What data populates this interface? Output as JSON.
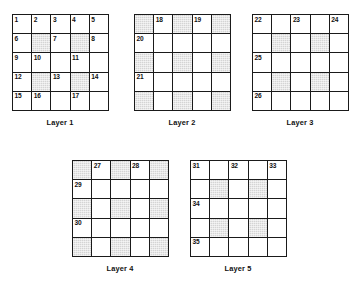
{
  "figure": {
    "title": "",
    "grid_size": 5,
    "shade_color": "#d4d4d4",
    "line_color": "#1a1a1a",
    "background": "#ffffff"
  },
  "layers": [
    {
      "caption": "Layer 1",
      "x": 12,
      "y": 14,
      "cells": [
        {
          "num": "1",
          "shaded": false
        },
        {
          "num": "2",
          "shaded": false
        },
        {
          "num": "3",
          "shaded": false
        },
        {
          "num": "4",
          "shaded": false
        },
        {
          "num": "5",
          "shaded": false
        },
        {
          "num": "6",
          "shaded": false
        },
        {
          "num": "",
          "shaded": true
        },
        {
          "num": "7",
          "shaded": false
        },
        {
          "num": "",
          "shaded": true
        },
        {
          "num": "8",
          "shaded": false
        },
        {
          "num": "9",
          "shaded": false
        },
        {
          "num": "10",
          "shaded": false
        },
        {
          "num": "",
          "shaded": false
        },
        {
          "num": "11",
          "shaded": false
        },
        {
          "num": "",
          "shaded": false
        },
        {
          "num": "12",
          "shaded": false
        },
        {
          "num": "",
          "shaded": true
        },
        {
          "num": "13",
          "shaded": false
        },
        {
          "num": "",
          "shaded": true
        },
        {
          "num": "14",
          "shaded": false
        },
        {
          "num": "15",
          "shaded": false
        },
        {
          "num": "16",
          "shaded": false
        },
        {
          "num": "",
          "shaded": false
        },
        {
          "num": "17",
          "shaded": false
        },
        {
          "num": "",
          "shaded": false
        }
      ]
    },
    {
      "caption": "Layer 2",
      "x": 134,
      "y": 14,
      "cells": [
        {
          "num": "",
          "shaded": true
        },
        {
          "num": "18",
          "shaded": false
        },
        {
          "num": "",
          "shaded": true
        },
        {
          "num": "19",
          "shaded": false
        },
        {
          "num": "",
          "shaded": true
        },
        {
          "num": "20",
          "shaded": false
        },
        {
          "num": "",
          "shaded": false
        },
        {
          "num": "",
          "shaded": false
        },
        {
          "num": "",
          "shaded": false
        },
        {
          "num": "",
          "shaded": false
        },
        {
          "num": "",
          "shaded": true
        },
        {
          "num": "",
          "shaded": false
        },
        {
          "num": "",
          "shaded": true
        },
        {
          "num": "",
          "shaded": false
        },
        {
          "num": "",
          "shaded": true
        },
        {
          "num": "21",
          "shaded": false
        },
        {
          "num": "",
          "shaded": false
        },
        {
          "num": "",
          "shaded": false
        },
        {
          "num": "",
          "shaded": false
        },
        {
          "num": "",
          "shaded": false
        },
        {
          "num": "",
          "shaded": true
        },
        {
          "num": "",
          "shaded": false
        },
        {
          "num": "",
          "shaded": true
        },
        {
          "num": "",
          "shaded": false
        },
        {
          "num": "",
          "shaded": true
        }
      ]
    },
    {
      "caption": "Layer 3",
      "x": 252,
      "y": 14,
      "cells": [
        {
          "num": "22",
          "shaded": false
        },
        {
          "num": "",
          "shaded": false
        },
        {
          "num": "23",
          "shaded": false
        },
        {
          "num": "",
          "shaded": false
        },
        {
          "num": "24",
          "shaded": false
        },
        {
          "num": "",
          "shaded": false
        },
        {
          "num": "",
          "shaded": true
        },
        {
          "num": "",
          "shaded": false
        },
        {
          "num": "",
          "shaded": true
        },
        {
          "num": "",
          "shaded": false
        },
        {
          "num": "25",
          "shaded": false
        },
        {
          "num": "",
          "shaded": false
        },
        {
          "num": "",
          "shaded": false
        },
        {
          "num": "",
          "shaded": false
        },
        {
          "num": "",
          "shaded": false
        },
        {
          "num": "",
          "shaded": false
        },
        {
          "num": "",
          "shaded": true
        },
        {
          "num": "",
          "shaded": false
        },
        {
          "num": "",
          "shaded": true
        },
        {
          "num": "",
          "shaded": false
        },
        {
          "num": "26",
          "shaded": false
        },
        {
          "num": "",
          "shaded": false
        },
        {
          "num": "",
          "shaded": false
        },
        {
          "num": "",
          "shaded": false
        },
        {
          "num": "",
          "shaded": false
        }
      ]
    },
    {
      "caption": "Layer 4",
      "x": 72,
      "y": 160,
      "cells": [
        {
          "num": "",
          "shaded": true
        },
        {
          "num": "27",
          "shaded": false
        },
        {
          "num": "",
          "shaded": true
        },
        {
          "num": "28",
          "shaded": false
        },
        {
          "num": "",
          "shaded": true
        },
        {
          "num": "29",
          "shaded": false
        },
        {
          "num": "",
          "shaded": false
        },
        {
          "num": "",
          "shaded": false
        },
        {
          "num": "",
          "shaded": false
        },
        {
          "num": "",
          "shaded": false
        },
        {
          "num": "",
          "shaded": true
        },
        {
          "num": "",
          "shaded": false
        },
        {
          "num": "",
          "shaded": true
        },
        {
          "num": "",
          "shaded": false
        },
        {
          "num": "",
          "shaded": true
        },
        {
          "num": "30",
          "shaded": false
        },
        {
          "num": "",
          "shaded": false
        },
        {
          "num": "",
          "shaded": false
        },
        {
          "num": "",
          "shaded": false
        },
        {
          "num": "",
          "shaded": false
        },
        {
          "num": "",
          "shaded": true
        },
        {
          "num": "",
          "shaded": false
        },
        {
          "num": "",
          "shaded": true
        },
        {
          "num": "",
          "shaded": false
        },
        {
          "num": "",
          "shaded": true
        }
      ]
    },
    {
      "caption": "Layer 5",
      "x": 190,
      "y": 160,
      "cells": [
        {
          "num": "31",
          "shaded": false
        },
        {
          "num": "",
          "shaded": false
        },
        {
          "num": "32",
          "shaded": false
        },
        {
          "num": "",
          "shaded": false
        },
        {
          "num": "33",
          "shaded": false
        },
        {
          "num": "",
          "shaded": false
        },
        {
          "num": "",
          "shaded": true
        },
        {
          "num": "",
          "shaded": false
        },
        {
          "num": "",
          "shaded": true
        },
        {
          "num": "",
          "shaded": false
        },
        {
          "num": "34",
          "shaded": false
        },
        {
          "num": "",
          "shaded": false
        },
        {
          "num": "",
          "shaded": false
        },
        {
          "num": "",
          "shaded": false
        },
        {
          "num": "",
          "shaded": false
        },
        {
          "num": "",
          "shaded": false
        },
        {
          "num": "",
          "shaded": true
        },
        {
          "num": "",
          "shaded": false
        },
        {
          "num": "",
          "shaded": true
        },
        {
          "num": "",
          "shaded": false
        },
        {
          "num": "35",
          "shaded": false
        },
        {
          "num": "",
          "shaded": false
        },
        {
          "num": "",
          "shaded": false
        },
        {
          "num": "",
          "shaded": false
        },
        {
          "num": "",
          "shaded": false
        }
      ]
    }
  ]
}
